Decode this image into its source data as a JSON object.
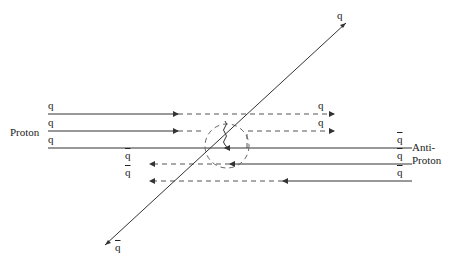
{
  "diagram": {
    "labels": {
      "proton": "Proton",
      "antiproton_line1": "Anti-",
      "antiproton_line2": "Proton",
      "quark": "q",
      "antiquark": "q"
    },
    "proton_quarks": [
      {
        "label": "q",
        "y": 114,
        "continues": "dashed",
        "out_label": "q"
      },
      {
        "label": "q",
        "y": 131,
        "continues": "dashed-scattered",
        "out_label": "q"
      },
      {
        "label": "q",
        "y": 148,
        "continues": "solid"
      }
    ],
    "antiproton_quarks": [
      {
        "label": "q̄",
        "y": 148
      },
      {
        "label": "q̄",
        "y": 164
      },
      {
        "label": "q̄",
        "y": 181
      }
    ],
    "outgoing": {
      "top_right": "q",
      "bottom_left": "q̄"
    },
    "colors": {
      "line": "#333333",
      "dash": "#555555"
    }
  }
}
